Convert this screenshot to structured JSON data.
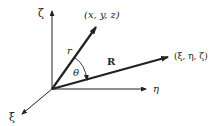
{
  "diagram": {
    "axes": {
      "zeta": "ζ",
      "eta": "η",
      "xi": "ξ"
    },
    "vectors": {
      "r": "r",
      "R": "R"
    },
    "angle": "θ",
    "points": {
      "field_point": "(x, y, z)",
      "source_point": "(ξ, η, ζ)"
    },
    "colors": {
      "ink": "#222222",
      "background": "#ffffff"
    }
  }
}
